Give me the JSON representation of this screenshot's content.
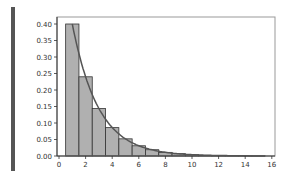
{
  "chart_data": {
    "type": "bar",
    "title": "",
    "xlabel": "",
    "ylabel": "",
    "categories": [
      1,
      2,
      3,
      4,
      5,
      6,
      7,
      8,
      9,
      10,
      11,
      12,
      13,
      14,
      15
    ],
    "series": [
      {
        "name": "histogram",
        "type": "bar",
        "values": [
          0.4,
          0.24,
          0.144,
          0.086,
          0.052,
          0.031,
          0.019,
          0.011,
          0.007,
          0.004,
          0.002,
          0.001,
          0.001,
          0.0005,
          0.0003
        ]
      },
      {
        "name": "pmf curve",
        "type": "line",
        "values": [
          0.4,
          0.24,
          0.144,
          0.086,
          0.052,
          0.031,
          0.019,
          0.011,
          0.007,
          0.004,
          0.002,
          0.001,
          0.001,
          0.0005,
          0.0003
        ]
      }
    ],
    "xlim": [
      -0.5,
      16.3
    ],
    "ylim": [
      0,
      0.42
    ],
    "xticks": [
      "0",
      "2",
      "4",
      "6",
      "8",
      "10",
      "12",
      "14",
      "16"
    ],
    "yticks": [
      "0.00",
      "0.05",
      "0.10",
      "0.15",
      "0.20",
      "0.25",
      "0.30",
      "0.35",
      "0.40"
    ],
    "grid": false,
    "legend": null,
    "colors": {
      "bar_fill": "#b0b0b0",
      "bar_edge": "#333333",
      "line": "#555555",
      "frame": "#999999"
    }
  }
}
